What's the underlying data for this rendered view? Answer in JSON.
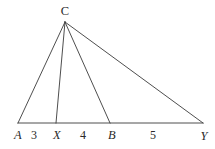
{
  "figure": {
    "name": "triangle-with-cevians",
    "background_color": "#ffffff",
    "stroke_color": "#3a3a3a",
    "label_color": "#2a2a2a",
    "stroke_width": 0.9,
    "width": 215,
    "height": 149
  },
  "vertices": [
    {
      "id": "A",
      "label": "A",
      "x": 18,
      "y": 123,
      "label_x": 18,
      "label_y": 135,
      "style": "italic"
    },
    {
      "id": "X",
      "label": "X",
      "x": 56,
      "y": 123,
      "label_x": 57,
      "label_y": 135,
      "style": "italic"
    },
    {
      "id": "B",
      "label": "B",
      "x": 110,
      "y": 123,
      "label_x": 112,
      "label_y": 135,
      "style": "italic"
    },
    {
      "id": "Y",
      "label": "Y",
      "x": 203,
      "y": 123,
      "label_x": 204,
      "label_y": 136,
      "style": "italic"
    },
    {
      "id": "C",
      "label": "C",
      "x": 65,
      "y": 22,
      "label_x": 65,
      "label_y": 11,
      "style": "upright"
    }
  ],
  "segments": [
    {
      "name": "segment-A-Y-baseline",
      "from": "A",
      "to": "Y"
    },
    {
      "name": "segment-C-A",
      "from": "C",
      "to": "A"
    },
    {
      "name": "segment-C-X",
      "from": "C",
      "to": "X"
    },
    {
      "name": "segment-C-B",
      "from": "C",
      "to": "B"
    },
    {
      "name": "segment-C-Y",
      "from": "C",
      "to": "Y"
    }
  ],
  "measures": [
    {
      "name": "length-A-X",
      "label": "3",
      "x": 34,
      "y": 135,
      "between": "A-X"
    },
    {
      "name": "length-X-B",
      "label": "4",
      "x": 83,
      "y": 135,
      "between": "X-B"
    },
    {
      "name": "length-B-Y",
      "label": "5",
      "x": 153,
      "y": 135,
      "between": "B-Y"
    }
  ]
}
